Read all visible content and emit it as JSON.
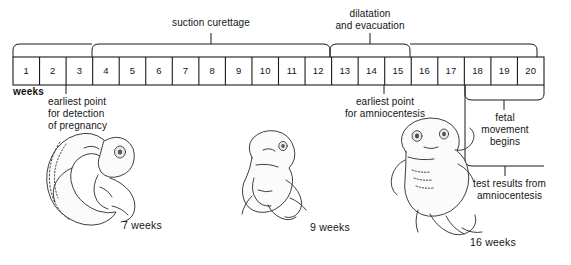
{
  "figure": {
    "axis_unit_label": "weeks",
    "line_color": "#1a1a1a",
    "background": "#ffffff"
  },
  "timeline": {
    "weeks": [
      "1",
      "2",
      "3",
      "4",
      "5",
      "6",
      "7",
      "8",
      "9",
      "10",
      "11",
      "12",
      "13",
      "14",
      "15",
      "16",
      "17",
      "18",
      "19",
      "20"
    ],
    "start_week": 1,
    "end_week": 20
  },
  "brackets": [
    {
      "name": "suction-curettage",
      "label": "suction curettage",
      "span_start_week": 4,
      "span_end_week": 12,
      "position": "above"
    },
    {
      "name": "dilatation-and-evacuation",
      "label": "dilatation\nand evacuation",
      "span_start_week": 13,
      "span_end_week": 15,
      "position": "above"
    },
    {
      "name": "fetal-movement",
      "label": "fetal\nmovement\nbegins",
      "span_start_week": 18,
      "span_end_week": 20,
      "position": "below"
    },
    {
      "name": "test-results-amniocentesis",
      "label": "test results from\namniocentesis",
      "span_start_week": 17,
      "span_end_week": 20,
      "position": "below"
    }
  ],
  "annotations": [
    {
      "name": "earliest-detection-pregnancy",
      "label": "earliest point\nfor detection\nof pregnancy",
      "marker_week": 3
    },
    {
      "name": "earliest-amniocentesis",
      "label": "earliest point\nfor amniocentesis",
      "marker_week": 14
    }
  ],
  "figures": [
    {
      "name": "embryo-7-weeks",
      "caption": "7 weeks"
    },
    {
      "name": "fetus-9-weeks",
      "caption": "9 weeks"
    },
    {
      "name": "fetus-16-weeks",
      "caption": "16 weeks"
    }
  ]
}
